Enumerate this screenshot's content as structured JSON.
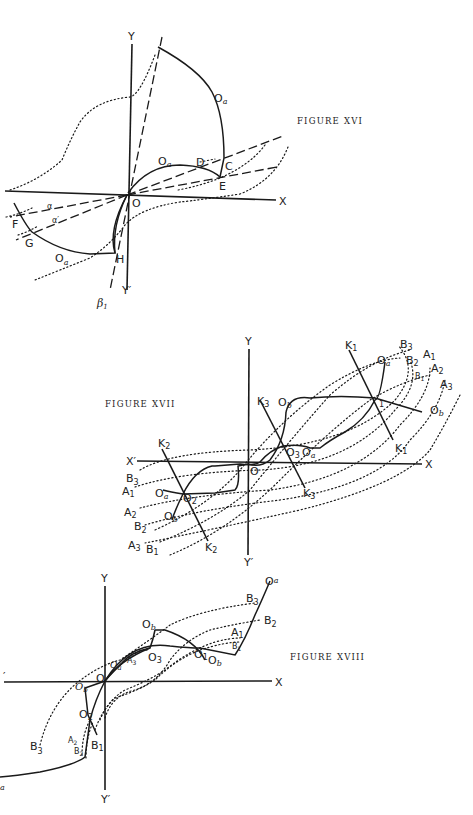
{
  "figures": [
    {
      "caption": "FIGURE XVI",
      "labels": {
        "y": "Y",
        "y_prime": "Y′",
        "x": "X",
        "origin": "O",
        "oa_top": "O",
        "oa_top_sub": "a",
        "oa_mid": "O",
        "oa_mid_sub": "a",
        "oa_bottom": "O",
        "oa_bottom_sub": "a",
        "d": "D",
        "c": "C",
        "e": "E",
        "f": "F",
        "g": "G",
        "h": "H",
        "alpha": "α",
        "alpha_prime": "α′",
        "beta": "β",
        "beta_sub": "1"
      }
    },
    {
      "caption": "FIGURE XVII",
      "labels": {
        "y": "Y",
        "y_prime": "Y′",
        "x": "X",
        "x_prime": "X′",
        "origin": "O",
        "k1_top": "K",
        "k1_top_sub": "1",
        "k1_bottom": "K",
        "k1_bottom_sub": "1",
        "k2_top": "K",
        "k2_top_sub": "2",
        "k2_bottom": "K",
        "k2_bottom_sub": "2",
        "k3_top": "K",
        "k3_top_sub": "3",
        "k3_bottom": "K",
        "k3_bottom_sub": "3",
        "ob_mid": "O",
        "ob_mid_sub": "b",
        "ob_right": "O",
        "ob_right_sub": "b",
        "ob_left": "O",
        "ob_left_sub": "b",
        "oa_top": "O",
        "oa_top_sub": "a",
        "oa_mid": "O",
        "oa_mid_sub": "a",
        "oa_left": "O",
        "oa_left_sub": "a",
        "o2": "O",
        "o2_sub": "2",
        "o3": "O",
        "o3_sub": "3",
        "o1_sub": "1",
        "b3_r": "B",
        "b3_r_sub": "3",
        "b2_r": "B",
        "b2_r_sub": "2",
        "b1_r": "B",
        "b1_r_sub": "1",
        "a1_r": "A",
        "a1_r_sub": "1",
        "a2_r": "A",
        "a2_r_sub": "2",
        "a3_r": "A",
        "a3_r_sub": "3",
        "b3_l": "B",
        "b3_l_sub": "3",
        "a1_l": "A",
        "a1_l_sub": "1",
        "a2_l": "A",
        "a2_l_sub": "2",
        "b2_l": "B",
        "b2_l_sub": "2",
        "a3_l": "A",
        "a3_l_sub": "3",
        "b1_l": "B",
        "b1_l_sub": "1"
      }
    },
    {
      "caption": "FIGURE XVIII",
      "labels": {
        "y": "Y",
        "y_prime": "Y′",
        "x": "X",
        "x_prime": "′",
        "origin": "O",
        "oa_top": "O",
        "oa_top_sub": "a",
        "ob_top": "O",
        "ob_top_sub": "b",
        "ob_right": "O",
        "ob_right_sub": "b",
        "ob_left": "O",
        "ob_left_sub": "b",
        "oa_mid": "O",
        "oa_mid_sub": "a",
        "oa_bottom_sub": "a",
        "o1": "O",
        "o1_sub": "1",
        "o2": "O",
        "o2_sub": "2",
        "o3": "O",
        "o3_sub": "3",
        "b3_r": "B",
        "b3_r_sub": "3",
        "b2_r": "B",
        "b2_r_sub": "2",
        "a1_r": "A",
        "a1_r_sub": "1",
        "b1_r": "B",
        "b1_r_sub": "1",
        "a3": "A",
        "a3_sub": "3",
        "b3_l": "B",
        "b3_l_sub": "3",
        "a2_l": "A",
        "a2_l_sub": "2",
        "b2_l": "B",
        "b2_l_sub": "2",
        "b1_l": "B",
        "b1_l_sub": "1"
      }
    }
  ]
}
